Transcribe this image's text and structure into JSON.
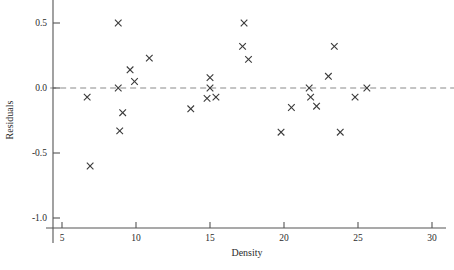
{
  "chart_data": {
    "type": "scatter",
    "title": "",
    "xlabel": "Density",
    "ylabel": "Residuals",
    "xlim": [
      4.2,
      30.8
    ],
    "ylim": [
      -1.13,
      0.63
    ],
    "xticks": [
      5,
      10,
      15,
      20,
      25,
      30
    ],
    "xtick_labels": [
      "5",
      "10",
      "15",
      "20",
      "25",
      "30"
    ],
    "yticks": [
      0.5,
      0.0,
      -0.5,
      -1.0
    ],
    "ytick_labels": [
      "0.5",
      "0.0",
      "-0.5",
      "-1.0"
    ],
    "grid": false,
    "legend": null,
    "marker": "x",
    "marker_color": "#3a3a3a",
    "reference_line": {
      "type": "horizontal",
      "y": 0.0,
      "style": "dashed",
      "color": "#8a8a8a"
    },
    "x": [
      6.7,
      6.9,
      8.8,
      8.8,
      8.9,
      9.1,
      9.6,
      9.9,
      10.9,
      13.7,
      14.8,
      15.0,
      15.0,
      15.4,
      17.2,
      17.3,
      17.6,
      19.8,
      20.5,
      21.7,
      21.8,
      22.2,
      23.0,
      23.4,
      23.8,
      24.8,
      25.6
    ],
    "y": [
      -0.07,
      -0.6,
      0.5,
      0.0,
      -0.33,
      -0.19,
      0.14,
      0.05,
      0.23,
      -0.16,
      -0.08,
      0.08,
      0.0,
      -0.07,
      0.32,
      0.5,
      0.22,
      -0.34,
      -0.15,
      0.0,
      -0.07,
      -0.14,
      0.09,
      0.32,
      -0.34,
      -0.07,
      0.0
    ],
    "points": [
      {
        "x": 6.7,
        "y": -0.07
      },
      {
        "x": 6.9,
        "y": -0.6
      },
      {
        "x": 8.8,
        "y": 0.5
      },
      {
        "x": 8.8,
        "y": 0.0
      },
      {
        "x": 8.9,
        "y": -0.33
      },
      {
        "x": 9.1,
        "y": -0.19
      },
      {
        "x": 9.6,
        "y": 0.14
      },
      {
        "x": 9.9,
        "y": 0.05
      },
      {
        "x": 10.9,
        "y": 0.23
      },
      {
        "x": 13.7,
        "y": -0.16
      },
      {
        "x": 14.8,
        "y": -0.08
      },
      {
        "x": 15.0,
        "y": 0.08
      },
      {
        "x": 15.0,
        "y": 0.0
      },
      {
        "x": 15.4,
        "y": -0.07
      },
      {
        "x": 17.2,
        "y": 0.32
      },
      {
        "x": 17.3,
        "y": 0.5
      },
      {
        "x": 17.6,
        "y": 0.22
      },
      {
        "x": 19.8,
        "y": -0.34
      },
      {
        "x": 20.5,
        "y": -0.15
      },
      {
        "x": 21.7,
        "y": 0.0
      },
      {
        "x": 21.8,
        "y": -0.07
      },
      {
        "x": 22.2,
        "y": -0.14
      },
      {
        "x": 23.0,
        "y": 0.09
      },
      {
        "x": 23.4,
        "y": 0.32
      },
      {
        "x": 23.8,
        "y": -0.34
      },
      {
        "x": 24.8,
        "y": -0.07
      },
      {
        "x": 25.6,
        "y": 0.0
      }
    ]
  },
  "axes": {
    "x_title": "Density",
    "y_title": "Residuals"
  }
}
